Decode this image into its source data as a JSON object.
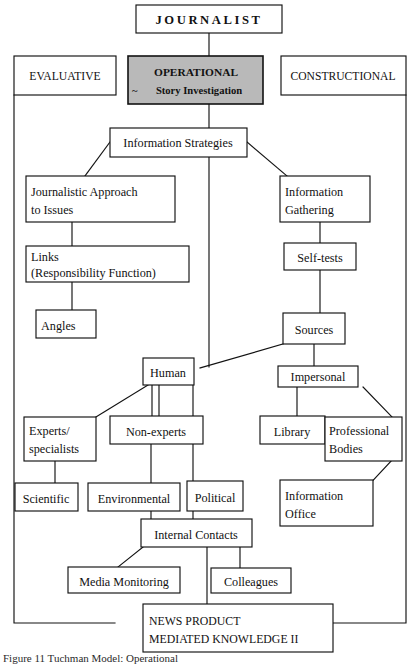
{
  "figure": {
    "top_node": {
      "label": "JOURNALIST"
    },
    "columns": {
      "left": {
        "label": "EVALUATIVE"
      },
      "center": {
        "label_line1": "OPERATIONAL",
        "label_line2": "Story Investigation",
        "tilde": "~",
        "fill": "#b9b9b9"
      },
      "right": {
        "label": "CONSTRUCTIONAL"
      }
    },
    "nodes": [
      {
        "id": "information-strategies",
        "label": "Information Strategies"
      },
      {
        "id": "journalistic-approach",
        "label_line1": "Journalistic Approach",
        "label_line2": "to Issues"
      },
      {
        "id": "information-gathering",
        "label_line1": "Information",
        "label_line2": "Gathering"
      },
      {
        "id": "links",
        "label_line1": "Links",
        "label_line2": "(Responsibility Function)"
      },
      {
        "id": "self-tests",
        "label": "Self-tests"
      },
      {
        "id": "angles",
        "label": "Angles"
      },
      {
        "id": "sources",
        "label": "Sources"
      },
      {
        "id": "human",
        "label": "Human"
      },
      {
        "id": "impersonal",
        "label": "Impersonal"
      },
      {
        "id": "experts-specialists",
        "label_line1": "Experts/",
        "label_line2": "specialists"
      },
      {
        "id": "non-experts",
        "label": "Non-experts"
      },
      {
        "id": "library",
        "label": "Library"
      },
      {
        "id": "professional-bodies",
        "label_line1": "Professional",
        "label_line2": "Bodies"
      },
      {
        "id": "scientific",
        "label": "Scientific"
      },
      {
        "id": "environmental",
        "label": "Environmental"
      },
      {
        "id": "political",
        "label": "Political"
      },
      {
        "id": "information-office",
        "label_line1": "Information",
        "label_line2": "Office"
      },
      {
        "id": "internal-contacts",
        "label": "Internal Contacts"
      },
      {
        "id": "media-monitoring",
        "label": "Media Monitoring"
      },
      {
        "id": "colleagues",
        "label": "Colleagues"
      },
      {
        "id": "news-product",
        "label_line1": "NEWS PRODUCT",
        "label_line2": "MEDIATED KNOWLEDGE II"
      }
    ],
    "caption": "Figure 11 Tuchman Model: Operational",
    "colors": {
      "line": "#121212",
      "text": "#111111",
      "shaded_fill": "#b9b9b9",
      "page_bg": "#ffffff"
    }
  }
}
